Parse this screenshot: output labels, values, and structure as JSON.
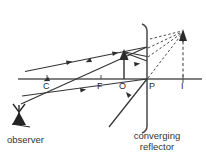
{
  "diagram": {
    "type": "optics-ray-diagram",
    "title_visible": false,
    "colors": {
      "line": "#3a3a3a",
      "axis": "#555555",
      "dashed": "#4a4a4a",
      "text": "#2d2d2d",
      "background": "#ffffff"
    },
    "principal_axis": {
      "label": "",
      "y": 79
    },
    "points": [
      {
        "name": "C",
        "label": "C",
        "x": 47,
        "y": 79,
        "label_x": 43,
        "label_y": 82
      },
      {
        "name": "F",
        "label": "F",
        "x": 101,
        "y": 79,
        "label_x": 97,
        "label_y": 82
      },
      {
        "name": "O",
        "label": "O",
        "x": 124,
        "y": 79,
        "label_x": 120,
        "label_y": 82
      },
      {
        "name": "P",
        "label": "P",
        "x": 147,
        "y": 79,
        "label_x": 149,
        "label_y": 82
      },
      {
        "name": "I",
        "label": "I",
        "x": 183,
        "y": 79,
        "label_x": 181,
        "label_y": 82
      }
    ],
    "object_arrow": {
      "name": "object",
      "base_x": 124,
      "base_y": 79,
      "tip_x": 124,
      "tip_y": 52
    },
    "image_arrow": {
      "name": "image",
      "base_x": 183,
      "base_y": 79,
      "tip_x": 183,
      "tip_y": 32
    },
    "mirror": {
      "name": "converging-reflector",
      "x": 147,
      "top_y": 24,
      "bottom_y": 132
    },
    "captions": [
      {
        "name": "observer-caption",
        "text": "observer",
        "x": 7,
        "y": 135
      },
      {
        "name": "reflector-caption-line1",
        "text": "converging",
        "x": 123,
        "y": 132
      },
      {
        "name": "reflector-caption-line2",
        "text": "reflector",
        "x": 132,
        "y": 143
      }
    ],
    "observer": {
      "name": "observer-figure",
      "x": 10,
      "y": 103,
      "width": 22,
      "height": 26
    },
    "rays": [
      {
        "name": "incident-parallel-ray",
        "style": "solid",
        "from": [
          27,
          71
        ],
        "to": [
          147,
          47
        ]
      },
      {
        "name": "reflected-ray-through-f",
        "style": "solid",
        "from": [
          147,
          47
        ],
        "to": [
          22,
          103
        ]
      },
      {
        "name": "incident-ray-through-center",
        "style": "solid",
        "from": [
          24,
          95
        ],
        "to": [
          147,
          79
        ]
      },
      {
        "name": "reflected-ray-lower",
        "style": "solid",
        "from": [
          147,
          79
        ],
        "to": [
          110,
          126
        ]
      },
      {
        "name": "chief-ray-to-object-tip",
        "style": "solid",
        "from": [
          147,
          56
        ],
        "to": [
          124,
          52
        ]
      },
      {
        "name": "ray-object-tip-to-mirror",
        "style": "solid",
        "from": [
          124,
          52
        ],
        "to": [
          147,
          60
        ]
      },
      {
        "name": "virtual-ray-1",
        "style": "dashed",
        "from": [
          147,
          79
        ],
        "to": [
          183,
          32
        ]
      },
      {
        "name": "virtual-ray-2",
        "style": "dashed",
        "from": [
          147,
          56
        ],
        "to": [
          183,
          32
        ]
      },
      {
        "name": "virtual-ray-3",
        "style": "dashed",
        "from": [
          147,
          47
        ],
        "to": [
          183,
          32
        ]
      },
      {
        "name": "virtual-ray-4",
        "style": "dashed",
        "from": [
          147,
          38
        ],
        "to": [
          183,
          32
        ]
      },
      {
        "name": "image-construction-line",
        "style": "dashed-vertical",
        "from": [
          183,
          36
        ],
        "to": [
          183,
          79
        ]
      }
    ],
    "ray_arrowheads": [
      {
        "name": "arrowhead-incident-upper",
        "x": 70,
        "y": 62,
        "angle": -11
      },
      {
        "name": "arrowhead-incident-upper-2",
        "x": 118,
        "y": 53,
        "angle": -11
      },
      {
        "name": "arrowhead-reflected-upper",
        "x": 86,
        "y": 64,
        "angle": 156
      },
      {
        "name": "arrowhead-reflected-upper-2",
        "x": 46,
        "y": 82,
        "angle": 156
      },
      {
        "name": "arrowhead-center-ray",
        "x": 84,
        "y": 87,
        "angle": -8
      },
      {
        "name": "arrowhead-center-ray-2",
        "x": 130,
        "y": 63,
        "angle": -8
      },
      {
        "name": "arrowhead-lower-reflected",
        "x": 126,
        "y": 100,
        "angle": -50
      }
    ]
  }
}
